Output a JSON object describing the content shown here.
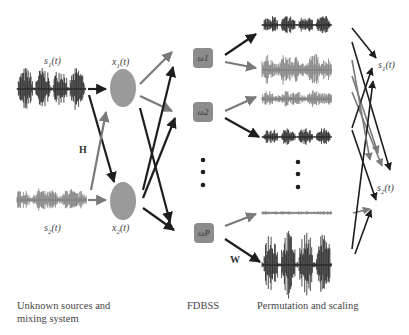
{
  "colors": {
    "dark": "#1e1e1e",
    "gray": "#7a7a7a",
    "node": "#9a9a9a",
    "box": "#8c8c8c"
  },
  "sources": [
    {
      "label": "s1(t)",
      "label_html_sub": "1",
      "type": "speech"
    },
    {
      "label": "s2(t)",
      "label_html_sub": "2",
      "type": "noise"
    }
  ],
  "mixtures": [
    {
      "label": "x1(t)"
    },
    {
      "label": "x2(t)"
    }
  ],
  "mixing_label": "H",
  "demix_label": "W",
  "frequency_bins": [
    {
      "label": "ω1"
    },
    {
      "label": "ω2"
    },
    {
      "label": "ωP"
    }
  ],
  "ellipsis": "⋮",
  "outputs": [
    {
      "label": "s1(t)"
    },
    {
      "label": "s2(t)"
    }
  ],
  "captions": {
    "left": "Unknown sources and mixing system",
    "middle": "FDBSS",
    "right": "Permutation and scaling"
  }
}
